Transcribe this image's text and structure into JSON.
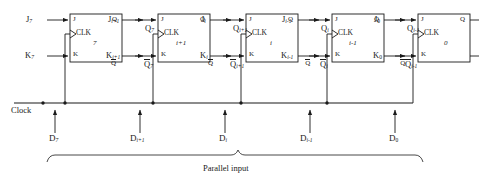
{
  "diagram": {
    "line_color": "#1a1a1a",
    "background": "#ffffff",
    "clock_label": "Clock",
    "parallel_input_label": "Parallel input",
    "port_labels": {
      "j": "J",
      "k": "K",
      "clk": "CLK",
      "q": "Q",
      "qbar": "Q"
    },
    "flipflops": [
      {
        "id": "ff-7",
        "number": "7",
        "j": "J",
        "j_sub": "7",
        "k": "K",
        "k_sub": "7",
        "q": "Q",
        "q_sub": "7",
        "qbar": "Q",
        "qbar_sub": "7",
        "d": "D",
        "d_sub": "7"
      },
      {
        "id": "ff-ip1",
        "number": "i+1",
        "j": "J",
        "j_sub": "i+1",
        "k": "K",
        "k_sub": "i+1",
        "q": "Q",
        "q_sub": "i+1",
        "qbar": "Q",
        "qbar_sub": "i+1",
        "d": "D",
        "d_sub": "i+1"
      },
      {
        "id": "ff-i",
        "number": "i",
        "j": "J",
        "j_sub": "i",
        "k": "K",
        "k_sub": "i",
        "q": "Q",
        "q_sub": "i",
        "qbar": "Q",
        "qbar_sub": "i",
        "d": "D",
        "d_sub": "i"
      },
      {
        "id": "ff-im1",
        "number": "i-1",
        "j": "J",
        "j_sub": "i-1",
        "k": "K",
        "k_sub": "i-1",
        "q": "Q",
        "q_sub": "i-1",
        "qbar": "Q",
        "qbar_sub": "i-1",
        "d": "D",
        "d_sub": "i-1"
      },
      {
        "id": "ff-0",
        "number": "0",
        "j": "J",
        "j_sub": "0",
        "k": "K",
        "k_sub": "0",
        "q": "Q",
        "q_sub": "0",
        "qbar": "Q",
        "qbar_sub": "0",
        "d": "D",
        "d_sub": "0"
      }
    ]
  }
}
